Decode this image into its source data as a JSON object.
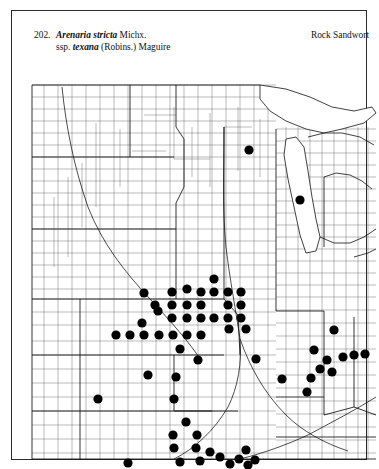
{
  "plate": {
    "number": "202.",
    "scientific_name_italic": "Arenaria stricta",
    "scientific_name_authority": "Michx.",
    "subspecies_prefix": "ssp.",
    "subspecies_italic": "texana",
    "subspecies_authority": "(Robins.) Maguire",
    "common_name": "Rock Sandwort",
    "frame_color": "#2b2b2b",
    "dot_color": "#000000",
    "county_line_color": "#3a3a3a",
    "state_line_color": "#111111"
  },
  "map": {
    "title": "Distribution map of Arenaria stricta ssp. texana",
    "region": "North Central and Eastern United States",
    "symbol_meaning": "filled circle indicates county occurrence record",
    "dot_radius": 4.6,
    "occurrence_dots": [
      {
        "x": 225,
        "y": 83
      },
      {
        "x": 276,
        "y": 133
      },
      {
        "x": 120,
        "y": 226
      },
      {
        "x": 134,
        "y": 244
      },
      {
        "x": 118,
        "y": 256
      },
      {
        "x": 163,
        "y": 222
      },
      {
        "x": 131,
        "y": 238
      },
      {
        "x": 190,
        "y": 212
      },
      {
        "x": 148,
        "y": 225
      },
      {
        "x": 163,
        "y": 238
      },
      {
        "x": 148,
        "y": 238
      },
      {
        "x": 177,
        "y": 225
      },
      {
        "x": 177,
        "y": 238
      },
      {
        "x": 190,
        "y": 225
      },
      {
        "x": 204,
        "y": 225
      },
      {
        "x": 204,
        "y": 238
      },
      {
        "x": 217,
        "y": 225
      },
      {
        "x": 217,
        "y": 238
      },
      {
        "x": 217,
        "y": 251
      },
      {
        "x": 204,
        "y": 251
      },
      {
        "x": 190,
        "y": 251
      },
      {
        "x": 177,
        "y": 251
      },
      {
        "x": 163,
        "y": 251
      },
      {
        "x": 148,
        "y": 251
      },
      {
        "x": 222,
        "y": 262
      },
      {
        "x": 205,
        "y": 262
      },
      {
        "x": 120,
        "y": 268
      },
      {
        "x": 106,
        "y": 268
      },
      {
        "x": 92,
        "y": 268
      },
      {
        "x": 135,
        "y": 268
      },
      {
        "x": 149,
        "y": 268
      },
      {
        "x": 163,
        "y": 268
      },
      {
        "x": 177,
        "y": 268
      },
      {
        "x": 156,
        "y": 282
      },
      {
        "x": 174,
        "y": 293
      },
      {
        "x": 232,
        "y": 292
      },
      {
        "x": 124,
        "y": 308
      },
      {
        "x": 152,
        "y": 310
      },
      {
        "x": 258,
        "y": 312
      },
      {
        "x": 74,
        "y": 332
      },
      {
        "x": 150,
        "y": 332
      },
      {
        "x": 310,
        "y": 263
      },
      {
        "x": 290,
        "y": 283
      },
      {
        "x": 303,
        "y": 293
      },
      {
        "x": 319,
        "y": 290
      },
      {
        "x": 330,
        "y": 288
      },
      {
        "x": 341,
        "y": 287
      },
      {
        "x": 296,
        "y": 302
      },
      {
        "x": 287,
        "y": 311
      },
      {
        "x": 308,
        "y": 305
      },
      {
        "x": 283,
        "y": 325
      },
      {
        "x": 162,
        "y": 355
      },
      {
        "x": 149,
        "y": 368
      },
      {
        "x": 173,
        "y": 368
      },
      {
        "x": 150,
        "y": 381
      },
      {
        "x": 172,
        "y": 381
      },
      {
        "x": 186,
        "y": 385
      },
      {
        "x": 196,
        "y": 390
      },
      {
        "x": 156,
        "y": 395
      },
      {
        "x": 176,
        "y": 394
      },
      {
        "x": 222,
        "y": 383
      },
      {
        "x": 215,
        "y": 392
      },
      {
        "x": 231,
        "y": 393
      },
      {
        "x": 206,
        "y": 397
      },
      {
        "x": 224,
        "y": 398
      },
      {
        "x": 104,
        "y": 396
      }
    ]
  }
}
